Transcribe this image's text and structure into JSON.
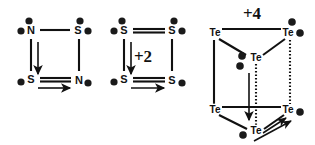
{
  "figure": {
    "name": "chalcogen-and-pnictogen-cluster-structures",
    "background_color": "#ffffff",
    "ink_color": "#111111",
    "width": 315,
    "height": 145
  },
  "structures": [
    {
      "id": "structure-1",
      "name": "dithiadiazene-square",
      "shape": "square",
      "charge_label": "",
      "vertices": [
        {
          "id": "s1-v-tl",
          "label": "N",
          "x": 31,
          "y": 32,
          "lone_pairs": [
            {
              "dx": -10,
              "dy": -1
            },
            {
              "dx": -3,
              "dy": -10
            }
          ]
        },
        {
          "id": "s1-v-tr",
          "label": "S",
          "x": 78,
          "y": 32,
          "lone_pairs": [
            {
              "dx": 9,
              "dy": -1
            },
            {
              "dx": 1,
              "dy": -10
            }
          ]
        },
        {
          "id": "s1-v-bl",
          "label": "S",
          "x": 31,
          "y": 80,
          "lone_pairs": [
            {
              "dx": -10,
              "dy": 3
            }
          ]
        },
        {
          "id": "s1-v-br",
          "label": "N",
          "x": 78,
          "y": 80,
          "lone_pairs": [
            {
              "dx": 9,
              "dy": 4
            }
          ]
        }
      ],
      "edges": [
        {
          "from": "s1-v-tl",
          "to": "s1-v-tr",
          "style": "solid"
        },
        {
          "from": "s1-v-tr",
          "to": "s1-v-br",
          "style": "solid"
        },
        {
          "from": "s1-v-bl",
          "to": "s1-v-br",
          "style": "double"
        },
        {
          "from": "s1-v-tl",
          "to": "s1-v-bl",
          "style": "solid"
        }
      ],
      "arrows": [
        {
          "id": "s1-arrow-down",
          "direction": "down",
          "x1": 38,
          "y1": 42,
          "x2": 38,
          "y2": 74
        },
        {
          "id": "s1-arrow-right",
          "direction": "right",
          "x1": 38,
          "y1": 88,
          "x2": 72,
          "y2": 88
        }
      ]
    },
    {
      "id": "structure-2",
      "name": "tetrasulfur-dication-square",
      "shape": "square",
      "charge_label": "+2",
      "charge_x": 143,
      "charge_y": 62,
      "vertices": [
        {
          "id": "s2-v-tl",
          "label": "S",
          "x": 124,
          "y": 32,
          "lone_pairs": [
            {
              "dx": -10,
              "dy": -1
            },
            {
              "dx": -2,
              "dy": -10
            }
          ]
        },
        {
          "id": "s2-v-tr",
          "label": "S",
          "x": 172,
          "y": 32,
          "lone_pairs": [
            {
              "dx": 9,
              "dy": -1
            },
            {
              "dx": 1,
              "dy": -10
            }
          ]
        },
        {
          "id": "s2-v-bl",
          "label": "S",
          "x": 124,
          "y": 80,
          "lone_pairs": [
            {
              "dx": -10,
              "dy": 3
            }
          ]
        },
        {
          "id": "s2-v-br",
          "label": "S",
          "x": 172,
          "y": 80,
          "lone_pairs": [
            {
              "dx": 9,
              "dy": 4
            }
          ]
        }
      ],
      "edges": [
        {
          "from": "s2-v-tl",
          "to": "s2-v-tr",
          "style": "double"
        },
        {
          "from": "s2-v-tr",
          "to": "s2-v-br",
          "style": "solid"
        },
        {
          "from": "s2-v-bl",
          "to": "s2-v-br",
          "style": "double"
        },
        {
          "from": "s2-v-tl",
          "to": "s2-v-bl",
          "style": "solid"
        }
      ],
      "arrows": [
        {
          "id": "s2-arrow-down",
          "direction": "down",
          "x1": 131,
          "y1": 42,
          "x2": 131,
          "y2": 74
        },
        {
          "id": "s2-arrow-right",
          "direction": "right",
          "x1": 131,
          "y1": 88,
          "x2": 166,
          "y2": 88
        }
      ]
    },
    {
      "id": "structure-3",
      "name": "hexatellurium-tetracation-trigonal-prism",
      "shape": "trigonal-prism",
      "charge_label": "+4",
      "charge_x": 252,
      "charge_y": 18,
      "vertices": [
        {
          "id": "s3-te-top-left",
          "label": "Te",
          "x": 215,
          "y": 33,
          "lone_pairs": []
        },
        {
          "id": "s3-te-top-right",
          "label": "Te",
          "x": 288,
          "y": 33,
          "lone_pairs": [
            {
              "dx": 11,
              "dy": 1
            },
            {
              "dx": 3,
              "dy": -10
            }
          ]
        },
        {
          "id": "s3-te-top-center",
          "label": "Te",
          "x": 256,
          "y": 57,
          "lone_pairs": [
            {
              "dx": -13,
              "dy": -1
            },
            {
              "dx": -16,
              "dy": 8
            }
          ]
        },
        {
          "id": "s3-te-bottom-left",
          "label": "Te",
          "x": 215,
          "y": 110,
          "lone_pairs": []
        },
        {
          "id": "s3-te-bottom-right",
          "label": "Te",
          "x": 288,
          "y": 110,
          "lone_pairs": [
            {
              "dx": 11,
              "dy": 2
            }
          ]
        },
        {
          "id": "s3-te-bottom-center",
          "label": "Te",
          "x": 256,
          "y": 131,
          "lone_pairs": [
            {
              "dx": -13,
              "dy": 3
            }
          ]
        }
      ],
      "edges": [
        {
          "from": "s3-te-top-left",
          "to": "s3-te-top-right",
          "style": "solid"
        },
        {
          "from": "s3-te-top-left",
          "to": "s3-te-top-center",
          "style": "solid"
        },
        {
          "from": "s3-te-top-right",
          "to": "s3-te-top-center",
          "style": "solid"
        },
        {
          "from": "s3-te-bottom-left",
          "to": "s3-te-bottom-right",
          "style": "solid"
        },
        {
          "from": "s3-te-bottom-left",
          "to": "s3-te-bottom-center",
          "style": "solid"
        },
        {
          "from": "s3-te-bottom-right",
          "to": "s3-te-bottom-center",
          "style": "solid"
        },
        {
          "from": "s3-te-top-left",
          "to": "s3-te-bottom-left",
          "style": "solid"
        },
        {
          "from": "s3-te-top-right",
          "to": "s3-te-bottom-right",
          "style": "dotted"
        },
        {
          "from": "s3-te-top-center",
          "to": "s3-te-bottom-center",
          "style": "dotted"
        }
      ],
      "arrows": [
        {
          "id": "s3-arrow-down",
          "direction": "down",
          "x1": 249,
          "y1": 73,
          "x2": 249,
          "y2": 122
        },
        {
          "id": "s3-arrow-up-right-inner",
          "direction": "up-right",
          "x1": 262,
          "y1": 133,
          "x2": 288,
          "y2": 117
        },
        {
          "id": "s3-arrow-up-right-outer",
          "direction": "up-right",
          "x1": 256,
          "y1": 141,
          "x2": 292,
          "y2": 120
        }
      ]
    }
  ]
}
